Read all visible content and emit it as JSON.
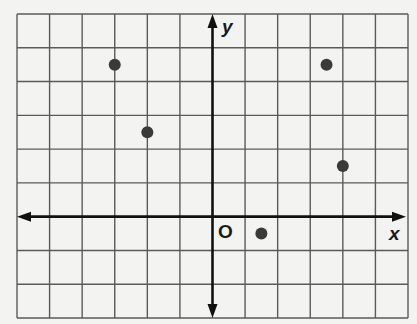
{
  "chart_data": {
    "type": "scatter",
    "title": "",
    "xlabel": "x",
    "ylabel": "y",
    "origin_label": "O",
    "grid": true,
    "tick_labels": false,
    "xlim": [
      -6,
      6
    ],
    "ylim": [
      -3,
      6
    ],
    "points": [
      {
        "x": -3,
        "y": 4.5
      },
      {
        "x": -2,
        "y": 2.5
      },
      {
        "x": 1.5,
        "y": -0.5
      },
      {
        "x": 3.5,
        "y": 4.5
      },
      {
        "x": 4,
        "y": 1.5
      }
    ]
  },
  "labels": {
    "x_axis": "x",
    "y_axis": "y",
    "origin": "O"
  },
  "colors": {
    "background": "#f3f3f2",
    "grid": "#5a5a5a",
    "axis": "#111111",
    "point": "#3a3a3a"
  }
}
